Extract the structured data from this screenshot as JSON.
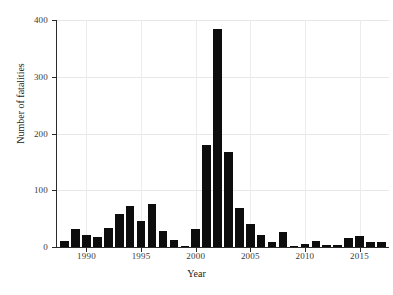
{
  "chart_data": {
    "type": "bar",
    "title": "",
    "xlabel": "Year",
    "ylabel": "Number of fatalities",
    "xlim": [
      1987.3,
      2017.7
    ],
    "ylim": [
      0,
      400
    ],
    "grid": true,
    "legend": null,
    "y_ticks": [
      0,
      100,
      200,
      300,
      400
    ],
    "x_ticks": [
      1990,
      1995,
      2000,
      2005,
      2010,
      2015
    ],
    "bar_color": "#0d0d0d",
    "categories": [
      1988,
      1989,
      1990,
      1991,
      1992,
      1993,
      1994,
      1995,
      1996,
      1997,
      1998,
      1999,
      2000,
      2001,
      2002,
      2003,
      2004,
      2005,
      2006,
      2007,
      2008,
      2009,
      2010,
      2011,
      2012,
      2013,
      2014,
      2015,
      2016,
      2017
    ],
    "values": [
      11,
      31,
      21,
      18,
      33,
      59,
      72,
      45,
      75,
      28,
      12,
      2,
      31,
      180,
      385,
      167,
      69,
      40,
      21,
      8,
      26,
      2,
      5,
      10,
      4,
      4,
      16,
      20,
      9,
      9
    ]
  },
  "axis": {
    "y_title": "Number of fatalities",
    "x_title": "Year",
    "y_tick_labels": [
      "0",
      "100",
      "200",
      "300",
      "400"
    ],
    "x_tick_labels": [
      "1990",
      "1995",
      "2000",
      "2005",
      "2010",
      "2015"
    ]
  }
}
